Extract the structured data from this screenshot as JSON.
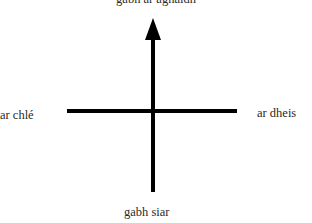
{
  "diagram": {
    "type": "direction-cross",
    "labels": {
      "top": "gabh ar aghaidh",
      "left": "ar chlé",
      "right": "ar dheis",
      "bottom": "gabh siar"
    },
    "colors": {
      "line": "#000000",
      "text": "#2a2a2a",
      "background": "#ffffff"
    }
  }
}
